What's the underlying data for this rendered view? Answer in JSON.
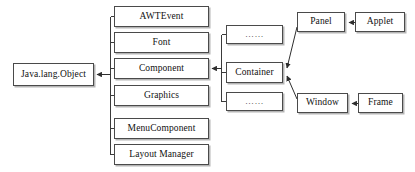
{
  "diagram": {
    "style": {
      "background": "#ffffff",
      "box_border": "#4a4a4a",
      "box_fill": "#ffffff",
      "text_color": "#111111",
      "line_color": "#3a3a3a"
    },
    "nodes": [
      {
        "id": "object",
        "label": "Java.lang.Object",
        "x": 13,
        "y": 63,
        "w": 81,
        "h": 23
      },
      {
        "id": "awtevent",
        "label": "AWTEvent",
        "x": 114,
        "y": 6,
        "w": 95,
        "h": 21
      },
      {
        "id": "font",
        "label": "Font",
        "x": 114,
        "y": 32,
        "w": 95,
        "h": 21
      },
      {
        "id": "component",
        "label": "Component",
        "x": 114,
        "y": 58,
        "w": 95,
        "h": 21
      },
      {
        "id": "graphics",
        "label": "Graphics",
        "x": 114,
        "y": 85,
        "w": 95,
        "h": 21
      },
      {
        "id": "menucomponent",
        "label": "MenuComponent",
        "x": 114,
        "y": 118,
        "w": 95,
        "h": 21
      },
      {
        "id": "layoutmanager",
        "label": "Layout Manager",
        "x": 114,
        "y": 144,
        "w": 95,
        "h": 21
      },
      {
        "id": "dots-top",
        "label": "……",
        "x": 226,
        "y": 25,
        "w": 57,
        "h": 19
      },
      {
        "id": "container",
        "label": "Container",
        "x": 226,
        "y": 62,
        "w": 57,
        "h": 21
      },
      {
        "id": "dots-bottom",
        "label": "……",
        "x": 226,
        "y": 92,
        "w": 57,
        "h": 19
      },
      {
        "id": "panel",
        "label": "Panel",
        "x": 297,
        "y": 12,
        "w": 48,
        "h": 20
      },
      {
        "id": "applet",
        "label": "Applet",
        "x": 355,
        "y": 12,
        "w": 50,
        "h": 20
      },
      {
        "id": "window",
        "label": "Window",
        "x": 297,
        "y": 93,
        "w": 51,
        "h": 20
      },
      {
        "id": "frame",
        "label": "Frame",
        "x": 358,
        "y": 93,
        "w": 45,
        "h": 20
      }
    ],
    "edges": [
      {
        "id": "object-trunk",
        "from": "awtevent,font,component,graphics,menucomponent,layoutmanager",
        "to": "object",
        "kind": "bracket-arrow-left"
      },
      {
        "id": "component-container",
        "from": "container-group",
        "to": "component",
        "kind": "bracket-arrow-left"
      },
      {
        "id": "panel-container",
        "from": "panel",
        "to": "container",
        "kind": "diagonal-arrow"
      },
      {
        "id": "window-container",
        "from": "window",
        "to": "container",
        "kind": "diagonal-arrow"
      },
      {
        "id": "applet-panel",
        "from": "applet",
        "to": "panel",
        "kind": "arrow-left"
      },
      {
        "id": "frame-window",
        "from": "frame",
        "to": "window",
        "kind": "arrow-left"
      }
    ]
  }
}
